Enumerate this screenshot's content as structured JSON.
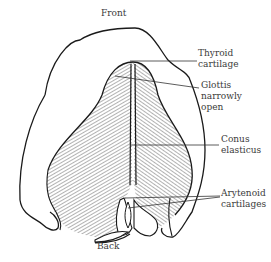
{
  "diagram": {
    "orientation": {
      "top": "Front",
      "bottom": "Back"
    },
    "labels": [
      {
        "id": "thyroid",
        "text": "Thyroid\ncartilage"
      },
      {
        "id": "glottis",
        "text": "Glottis\nnarrowly\nopen"
      },
      {
        "id": "conus",
        "text": "Conus\nelasticus"
      },
      {
        "id": "arytenoid",
        "text": "Arytenoid\ncartilages"
      }
    ],
    "colors": {
      "line": "#1a1a1a",
      "hatch": "#555555",
      "text": "#3a3a3a",
      "background": "#ffffff"
    }
  }
}
